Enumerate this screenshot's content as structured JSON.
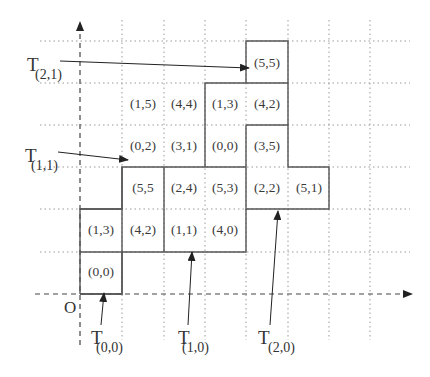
{
  "diagram": {
    "origin_label": "O",
    "grid": {
      "x_lines": [
        80,
        122,
        164,
        205,
        246,
        288,
        329,
        370
      ],
      "y_lines": [
        41,
        83,
        125,
        167,
        209,
        252,
        294
      ],
      "cell_size": 41.5,
      "origin_px": [
        80,
        294
      ]
    },
    "cells": [
      {
        "col": 0,
        "row": 0,
        "label": "(0,0)"
      },
      {
        "col": 0,
        "row": 1,
        "label": "(1,3)"
      },
      {
        "col": 1,
        "row": 1,
        "label": "(4,2)"
      },
      {
        "col": 2,
        "row": 1,
        "label": "(1,1)"
      },
      {
        "col": 3,
        "row": 1,
        "label": "(4,0)"
      },
      {
        "col": 1,
        "row": 2,
        "label": "(5,5"
      },
      {
        "col": 2,
        "row": 2,
        "label": "(2,4)"
      },
      {
        "col": 3,
        "row": 2,
        "label": "(5,3)"
      },
      {
        "col": 4,
        "row": 2,
        "label": "(2,2)"
      },
      {
        "col": 5,
        "row": 2,
        "label": "(5,1)"
      },
      {
        "col": 1,
        "row": 3,
        "label": "(0,2)"
      },
      {
        "col": 2,
        "row": 3,
        "label": "(3,1)"
      },
      {
        "col": 3,
        "row": 3,
        "label": "(0,0)"
      },
      {
        "col": 4,
        "row": 3,
        "label": "(3,5)"
      },
      {
        "col": 1,
        "row": 4,
        "label": "(1,5)"
      },
      {
        "col": 2,
        "row": 4,
        "label": "(4,4)"
      },
      {
        "col": 3,
        "row": 4,
        "label": "(1,3)"
      },
      {
        "col": 4,
        "row": 4,
        "label": "(4,2)"
      },
      {
        "col": 4,
        "row": 5,
        "label": "(5,5)"
      }
    ],
    "tiles": [
      {
        "name": "T",
        "sub": "(0,0)",
        "target_cell": "(0,0)"
      },
      {
        "name": "T",
        "sub": "(1,0)",
        "target_cell": "(1,1)"
      },
      {
        "name": "T",
        "sub": "(2,0)",
        "target_cell": "(2,2)"
      },
      {
        "name": "T",
        "sub": "(1,1)",
        "target_cell": "(0,2)"
      },
      {
        "name": "T",
        "sub": "(2,1)",
        "target_cell": "(5,5)"
      }
    ],
    "colors": {
      "grid": "#9a9a9a",
      "outline": "#555555",
      "axis": "#444444",
      "text": "#333333"
    }
  }
}
